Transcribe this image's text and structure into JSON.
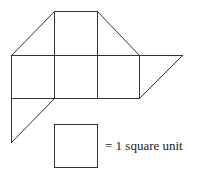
{
  "figure": {
    "unit_px": 43,
    "squares": [
      {
        "name": "top-middle-square",
        "col": 1,
        "row": 0
      },
      {
        "name": "middle-left-square",
        "col": 0,
        "row": 1
      },
      {
        "name": "middle-center-square",
        "col": 1,
        "row": 1
      },
      {
        "name": "middle-right-square",
        "col": 2,
        "row": 1
      }
    ],
    "triangles": [
      {
        "name": "top-left-triangle"
      },
      {
        "name": "top-right-triangle"
      },
      {
        "name": "right-parallelogram-triangle"
      },
      {
        "name": "bottom-left-triangle"
      }
    ]
  },
  "legend": {
    "label": "= 1 square unit"
  },
  "colors": {
    "stroke": "#333333",
    "background": "#ffffff"
  }
}
